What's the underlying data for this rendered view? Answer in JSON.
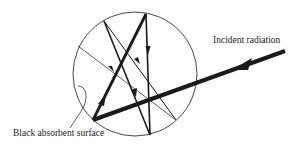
{
  "labels": {
    "incident": "Incident radiation",
    "surface": "Black absorbent surface"
  },
  "colors": {
    "ink": "#1a1a1a",
    "background": "#ffffff"
  },
  "geometry": {
    "circle": {
      "cx": 135,
      "cy": 74,
      "r": 62
    },
    "incident_ray": {
      "from": [
        285,
        51
      ],
      "to": [
        93,
        120
      ]
    },
    "reflections": [
      {
        "from": [
          93,
          120
        ],
        "to": [
          146,
          14
        ],
        "weight": "thick"
      },
      {
        "from": [
          146,
          14
        ],
        "to": [
          150,
          135
        ],
        "weight": "medium"
      },
      {
        "from": [
          150,
          135
        ],
        "to": [
          104,
          21
        ],
        "weight": "medium"
      },
      {
        "from": [
          104,
          21
        ],
        "to": [
          176,
          120
        ],
        "weight": "thin"
      },
      {
        "from": [
          78,
          46
        ],
        "to": [
          176,
          120
        ],
        "weight": "thin"
      }
    ]
  }
}
